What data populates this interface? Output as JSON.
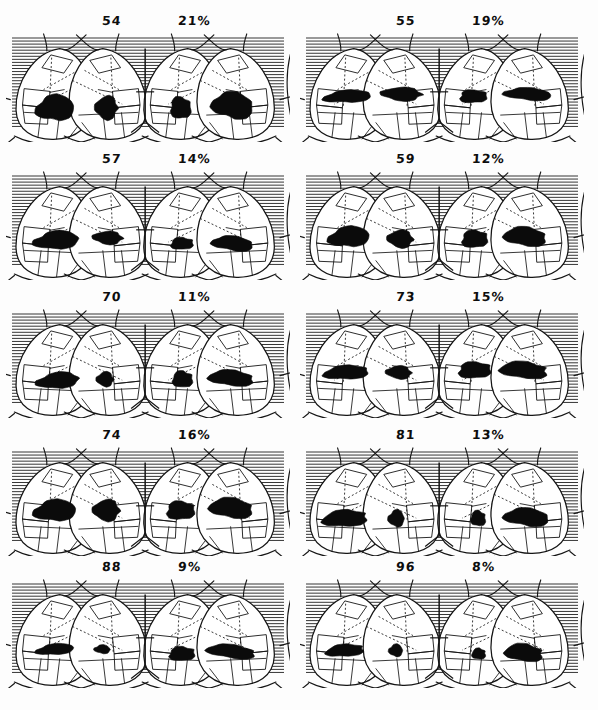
{
  "figure": {
    "caption": "",
    "panel_count": 10,
    "columns": 2,
    "rows": 5,
    "ink_color": "#111111",
    "scanline_color": "#2b2b2b",
    "background_color": "#fdfdfd"
  },
  "chart_data": {
    "type": "table",
    "xlabel": "",
    "ylabel": "",
    "columns": [
      "case_number",
      "percent"
    ],
    "categories": [
      "54",
      "55",
      "57",
      "59",
      "70",
      "73",
      "74",
      "81",
      "88",
      "96"
    ],
    "values": [
      21,
      19,
      14,
      12,
      11,
      15,
      16,
      13,
      9,
      8
    ]
  },
  "panels": [
    {
      "id": "panel-54",
      "number": "54",
      "percent": "21%",
      "row": 1,
      "column": "left",
      "defects": [
        {
          "view": "posterior-left",
          "cx": 0.175,
          "cy": 0.7,
          "rx": 0.072,
          "ry": 0.115,
          "rot": -6
        },
        {
          "view": "posterior-right",
          "cx": 0.355,
          "cy": 0.7,
          "rx": 0.042,
          "ry": 0.105,
          "rot": 4
        },
        {
          "view": "anterior-left",
          "cx": 0.615,
          "cy": 0.7,
          "rx": 0.038,
          "ry": 0.1,
          "rot": -4
        },
        {
          "view": "anterior-right",
          "cx": 0.8,
          "cy": 0.68,
          "rx": 0.078,
          "ry": 0.118,
          "rot": 6
        }
      ]
    },
    {
      "id": "panel-55",
      "number": "55",
      "percent": "19%",
      "row": 1,
      "column": "right",
      "defects": [
        {
          "view": "posterior-left",
          "cx": 0.17,
          "cy": 0.6,
          "rx": 0.09,
          "ry": 0.055,
          "rot": -4
        },
        {
          "view": "posterior-right",
          "cx": 0.36,
          "cy": 0.58,
          "rx": 0.075,
          "ry": 0.06,
          "rot": 2
        },
        {
          "view": "anterior-left",
          "cx": 0.61,
          "cy": 0.6,
          "rx": 0.05,
          "ry": 0.06,
          "rot": -2
        },
        {
          "view": "anterior-right",
          "cx": 0.805,
          "cy": 0.58,
          "rx": 0.09,
          "ry": 0.055,
          "rot": 3
        }
      ]
    },
    {
      "id": "panel-57",
      "number": "57",
      "percent": "14%",
      "row": 2,
      "column": "left",
      "defects": [
        {
          "view": "posterior-left",
          "cx": 0.18,
          "cy": 0.65,
          "rx": 0.085,
          "ry": 0.08,
          "rot": -5
        },
        {
          "view": "posterior-right",
          "cx": 0.36,
          "cy": 0.63,
          "rx": 0.055,
          "ry": 0.058,
          "rot": 3
        },
        {
          "view": "anterior-left",
          "cx": 0.62,
          "cy": 0.68,
          "rx": 0.042,
          "ry": 0.055,
          "rot": -3
        },
        {
          "view": "anterior-right",
          "cx": 0.8,
          "cy": 0.68,
          "rx": 0.078,
          "ry": 0.065,
          "rot": 5
        }
      ]
    },
    {
      "id": "panel-59",
      "number": "59",
      "percent": "12%",
      "row": 2,
      "column": "right",
      "defects": [
        {
          "view": "posterior-left",
          "cx": 0.175,
          "cy": 0.62,
          "rx": 0.078,
          "ry": 0.09,
          "rot": -6
        },
        {
          "view": "posterior-right",
          "cx": 0.355,
          "cy": 0.64,
          "rx": 0.048,
          "ry": 0.078,
          "rot": 4
        },
        {
          "view": "anterior-left",
          "cx": 0.615,
          "cy": 0.64,
          "rx": 0.048,
          "ry": 0.08,
          "rot": -4
        },
        {
          "view": "anterior-right",
          "cx": 0.795,
          "cy": 0.62,
          "rx": 0.08,
          "ry": 0.085,
          "rot": 5
        }
      ]
    },
    {
      "id": "panel-70",
      "number": "70",
      "percent": "11%",
      "row": 3,
      "column": "left",
      "defects": [
        {
          "view": "posterior-left",
          "cx": 0.185,
          "cy": 0.67,
          "rx": 0.08,
          "ry": 0.07,
          "rot": -6
        },
        {
          "view": "posterior-right",
          "cx": 0.35,
          "cy": 0.66,
          "rx": 0.032,
          "ry": 0.065,
          "rot": 2
        },
        {
          "view": "anterior-left",
          "cx": 0.622,
          "cy": 0.66,
          "rx": 0.038,
          "ry": 0.075,
          "rot": -3
        },
        {
          "view": "anterior-right",
          "cx": 0.795,
          "cy": 0.65,
          "rx": 0.085,
          "ry": 0.07,
          "rot": 4
        }
      ]
    },
    {
      "id": "panel-73",
      "number": "73",
      "percent": "15%",
      "row": 3,
      "column": "right",
      "defects": [
        {
          "view": "posterior-left",
          "cx": 0.165,
          "cy": 0.6,
          "rx": 0.085,
          "ry": 0.062,
          "rot": -4
        },
        {
          "view": "posterior-right",
          "cx": 0.35,
          "cy": 0.6,
          "rx": 0.048,
          "ry": 0.058,
          "rot": 3
        },
        {
          "view": "anterior-left",
          "cx": 0.615,
          "cy": 0.58,
          "rx": 0.06,
          "ry": 0.075,
          "rot": -3
        },
        {
          "view": "anterior-right",
          "cx": 0.79,
          "cy": 0.58,
          "rx": 0.09,
          "ry": 0.075,
          "rot": 4
        }
      ]
    },
    {
      "id": "panel-74",
      "number": "74",
      "percent": "16%",
      "row": 4,
      "column": "left",
      "defects": [
        {
          "view": "posterior-left",
          "cx": 0.175,
          "cy": 0.6,
          "rx": 0.08,
          "ry": 0.095,
          "rot": -5
        },
        {
          "view": "posterior-right",
          "cx": 0.355,
          "cy": 0.6,
          "rx": 0.05,
          "ry": 0.095,
          "rot": 3
        },
        {
          "view": "anterior-left",
          "cx": 0.615,
          "cy": 0.6,
          "rx": 0.052,
          "ry": 0.085,
          "rot": -3
        },
        {
          "view": "anterior-right",
          "cx": 0.795,
          "cy": 0.58,
          "rx": 0.082,
          "ry": 0.09,
          "rot": 5
        }
      ]
    },
    {
      "id": "panel-81",
      "number": "81",
      "percent": "13%",
      "row": 4,
      "column": "right",
      "defects": [
        {
          "view": "posterior-left",
          "cx": 0.16,
          "cy": 0.67,
          "rx": 0.085,
          "ry": 0.075,
          "rot": -4
        },
        {
          "view": "posterior-right",
          "cx": 0.34,
          "cy": 0.67,
          "rx": 0.03,
          "ry": 0.075,
          "rot": 2
        },
        {
          "view": "anterior-left",
          "cx": 0.628,
          "cy": 0.67,
          "rx": 0.028,
          "ry": 0.07,
          "rot": -2
        },
        {
          "view": "anterior-right",
          "cx": 0.8,
          "cy": 0.66,
          "rx": 0.085,
          "ry": 0.08,
          "rot": 4
        }
      ]
    },
    {
      "id": "panel-88",
      "number": "88",
      "percent": "9%",
      "row": 5,
      "column": "left",
      "defects": [
        {
          "view": "posterior-left",
          "cx": 0.175,
          "cy": 0.66,
          "rx": 0.072,
          "ry": 0.048,
          "rot": -6
        },
        {
          "view": "posterior-right",
          "cx": 0.34,
          "cy": 0.66,
          "rx": 0.03,
          "ry": 0.038,
          "rot": 2
        },
        {
          "view": "anterior-left",
          "cx": 0.62,
          "cy": 0.7,
          "rx": 0.048,
          "ry": 0.065,
          "rot": -4
        },
        {
          "view": "anterior-right",
          "cx": 0.795,
          "cy": 0.68,
          "rx": 0.092,
          "ry": 0.06,
          "rot": 6
        }
      ]
    },
    {
      "id": "panel-96",
      "number": "96",
      "percent": "8%",
      "row": 5,
      "column": "right",
      "defects": [
        {
          "view": "posterior-left",
          "cx": 0.16,
          "cy": 0.67,
          "rx": 0.072,
          "ry": 0.055,
          "rot": -5
        },
        {
          "view": "posterior-right",
          "cx": 0.338,
          "cy": 0.67,
          "rx": 0.026,
          "ry": 0.055,
          "rot": 2
        },
        {
          "view": "anterior-left",
          "cx": 0.63,
          "cy": 0.7,
          "rx": 0.026,
          "ry": 0.05,
          "rot": -2
        },
        {
          "view": "anterior-right",
          "cx": 0.79,
          "cy": 0.69,
          "rx": 0.072,
          "ry": 0.078,
          "rot": 5
        }
      ]
    }
  ]
}
